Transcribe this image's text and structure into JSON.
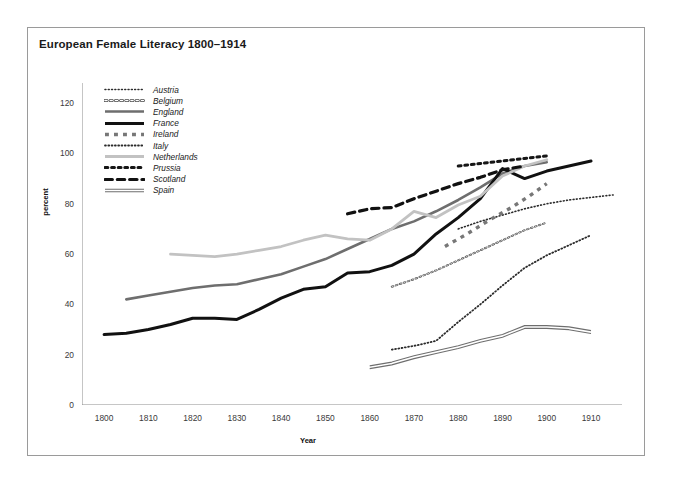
{
  "chart": {
    "title": "European Female Literacy 1800–1914",
    "xlabel": "Year",
    "ylabel": "percent"
  },
  "chart_data": {
    "type": "line",
    "title": "European Female Literacy 1800–1914",
    "xlabel": "Year",
    "ylabel": "percent",
    "xlim": [
      1795,
      1917
    ],
    "ylim": [
      0,
      128
    ],
    "xticks": [
      1800,
      1810,
      1820,
      1830,
      1840,
      1850,
      1860,
      1870,
      1880,
      1890,
      1900,
      1910
    ],
    "yticks": [
      0,
      20,
      40,
      60,
      80,
      100,
      120
    ],
    "grid": false,
    "legend_position": "upper-left-inside",
    "series": [
      {
        "name": "Austria",
        "style": "fine-dotted",
        "color": "#2b2b2b",
        "width": 1.6,
        "points": [
          [
            1880,
            70.0
          ],
          [
            1885,
            73.0
          ],
          [
            1890,
            75.5
          ],
          [
            1895,
            78.0
          ],
          [
            1900,
            80.0
          ],
          [
            1905,
            81.5
          ],
          [
            1910,
            82.5
          ],
          [
            1915,
            83.5
          ]
        ]
      },
      {
        "name": "Belgium",
        "style": "open-circle-dotted",
        "color": "#4a4a4a",
        "width": 2.0,
        "points": [
          [
            1865,
            47.0
          ],
          [
            1870,
            50.0
          ],
          [
            1875,
            53.5
          ],
          [
            1880,
            57.5
          ],
          [
            1885,
            61.5
          ],
          [
            1890,
            65.5
          ],
          [
            1895,
            69.5
          ],
          [
            1900,
            72.5
          ]
        ]
      },
      {
        "name": "England",
        "style": "solid",
        "color": "#6e6e6e",
        "width": 2.6,
        "points": [
          [
            1805,
            42.0
          ],
          [
            1810,
            43.5
          ],
          [
            1815,
            45.0
          ],
          [
            1820,
            46.5
          ],
          [
            1825,
            47.5
          ],
          [
            1830,
            48.0
          ],
          [
            1835,
            50.0
          ],
          [
            1840,
            52.0
          ],
          [
            1845,
            55.0
          ],
          [
            1850,
            58.0
          ],
          [
            1855,
            62.0
          ],
          [
            1860,
            66.0
          ],
          [
            1865,
            70.0
          ],
          [
            1870,
            73.0
          ],
          [
            1875,
            77.0
          ],
          [
            1880,
            81.5
          ],
          [
            1885,
            86.5
          ],
          [
            1890,
            92.0
          ],
          [
            1895,
            95.0
          ],
          [
            1900,
            96.5
          ]
        ]
      },
      {
        "name": "France",
        "style": "solid",
        "color": "#111111",
        "width": 3.0,
        "points": [
          [
            1800,
            28.0
          ],
          [
            1805,
            28.5
          ],
          [
            1810,
            30.0
          ],
          [
            1815,
            32.0
          ],
          [
            1820,
            34.5
          ],
          [
            1825,
            34.5
          ],
          [
            1830,
            34.0
          ],
          [
            1835,
            38.0
          ],
          [
            1840,
            42.5
          ],
          [
            1845,
            46.0
          ],
          [
            1850,
            47.0
          ],
          [
            1855,
            52.5
          ],
          [
            1860,
            53.0
          ],
          [
            1865,
            55.5
          ],
          [
            1870,
            60.0
          ],
          [
            1875,
            68.0
          ],
          [
            1880,
            74.5
          ],
          [
            1885,
            82.0
          ],
          [
            1890,
            94.0
          ],
          [
            1895,
            90.0
          ],
          [
            1900,
            93.0
          ],
          [
            1905,
            95.0
          ],
          [
            1910,
            97.0
          ]
        ]
      },
      {
        "name": "Ireland",
        "style": "square-dashed",
        "color": "#777777",
        "width": 3.4,
        "points": [
          [
            1877,
            63.0
          ],
          [
            1882,
            68.0
          ],
          [
            1887,
            73.5
          ],
          [
            1892,
            78.5
          ],
          [
            1896,
            83.0
          ],
          [
            1900,
            88.0
          ]
        ]
      },
      {
        "name": "Italy",
        "style": "fine-dotted",
        "color": "#2b2b2b",
        "width": 1.8,
        "points": [
          [
            1865,
            22.0
          ],
          [
            1870,
            23.5
          ],
          [
            1875,
            25.5
          ],
          [
            1880,
            33.0
          ],
          [
            1885,
            40.0
          ],
          [
            1890,
            47.5
          ],
          [
            1895,
            54.5
          ],
          [
            1900,
            59.5
          ],
          [
            1905,
            63.5
          ],
          [
            1910,
            67.5
          ]
        ]
      },
      {
        "name": "Netherlands",
        "style": "solid",
        "color": "#c2c2c2",
        "width": 2.8,
        "points": [
          [
            1815,
            60.0
          ],
          [
            1820,
            59.5
          ],
          [
            1825,
            59.0
          ],
          [
            1830,
            60.0
          ],
          [
            1835,
            61.5
          ],
          [
            1840,
            63.0
          ],
          [
            1845,
            65.5
          ],
          [
            1850,
            67.5
          ],
          [
            1855,
            66.0
          ],
          [
            1860,
            65.5
          ],
          [
            1865,
            70.0
          ],
          [
            1870,
            77.0
          ],
          [
            1875,
            74.5
          ],
          [
            1880,
            79.5
          ],
          [
            1885,
            83.0
          ],
          [
            1890,
            91.0
          ],
          [
            1895,
            95.0
          ],
          [
            1900,
            97.5
          ]
        ]
      },
      {
        "name": "Prussia",
        "style": "round-dotted",
        "color": "#161616",
        "width": 3.0,
        "points": [
          [
            1880,
            95.0
          ],
          [
            1885,
            96.0
          ],
          [
            1890,
            97.0
          ],
          [
            1895,
            98.0
          ],
          [
            1900,
            99.0
          ]
        ]
      },
      {
        "name": "Scotland",
        "style": "dashed",
        "color": "#111111",
        "width": 3.2,
        "points": [
          [
            1855,
            76.0
          ],
          [
            1860,
            78.0
          ],
          [
            1865,
            78.5
          ],
          [
            1870,
            82.0
          ],
          [
            1875,
            85.0
          ],
          [
            1880,
            88.0
          ],
          [
            1885,
            90.5
          ],
          [
            1890,
            93.5
          ],
          [
            1895,
            95.0
          ]
        ]
      },
      {
        "name": "Spain",
        "style": "double-solid",
        "color": "#6e6e6e",
        "width": 2.2,
        "points": [
          [
            1860,
            15.0
          ],
          [
            1865,
            16.5
          ],
          [
            1870,
            19.0
          ],
          [
            1875,
            21.0
          ],
          [
            1880,
            23.0
          ],
          [
            1885,
            25.5
          ],
          [
            1890,
            27.5
          ],
          [
            1895,
            31.0
          ],
          [
            1900,
            31.0
          ],
          [
            1905,
            30.5
          ],
          [
            1910,
            29.0
          ]
        ]
      }
    ]
  }
}
